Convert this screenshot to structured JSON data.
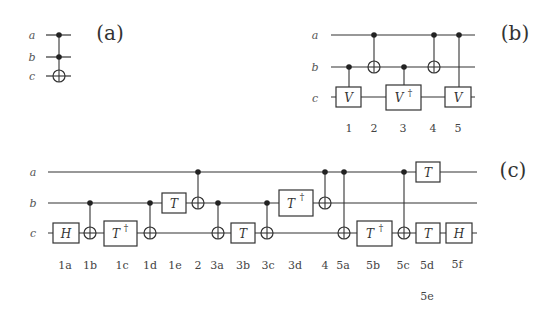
{
  "colors": {
    "background": "#ffffff",
    "ink": "#333333",
    "label": "#555555"
  },
  "panels": {
    "a": {
      "label": "(a)",
      "qubits": [
        "a",
        "b",
        "c"
      ],
      "description": "Toffoli gate: controls on a and b, target on c"
    },
    "b": {
      "label": "(b)",
      "qubits": [
        "a",
        "b",
        "c"
      ],
      "gates": [
        {
          "step": "1",
          "type": "controlled",
          "control": "b",
          "target": "c",
          "gate": "V"
        },
        {
          "step": "2",
          "type": "cnot",
          "control": "a",
          "target": "b"
        },
        {
          "step": "3",
          "type": "controlled",
          "control": "b",
          "target": "c",
          "gate": "V",
          "dagger": "†"
        },
        {
          "step": "4",
          "type": "cnot",
          "control": "a",
          "target": "b"
        },
        {
          "step": "5",
          "type": "controlled",
          "control": "a",
          "target": "c",
          "gate": "V"
        }
      ],
      "step_labels": [
        "1",
        "2",
        "3",
        "4",
        "5"
      ]
    },
    "c": {
      "label": "(c)",
      "qubits": [
        "a",
        "b",
        "c"
      ],
      "gates": [
        {
          "step": "1a",
          "type": "single",
          "target": "c",
          "gate": "H"
        },
        {
          "step": "1b",
          "type": "cnot",
          "control": "b",
          "target": "c"
        },
        {
          "step": "1c",
          "type": "single",
          "target": "c",
          "gate": "T",
          "dagger": "†"
        },
        {
          "step": "1d",
          "type": "cnot",
          "control": "b",
          "target": "c"
        },
        {
          "step": "1e",
          "type": "single",
          "target": "b",
          "gate": "T"
        },
        {
          "step": "2",
          "type": "cnot",
          "control": "a",
          "target": "b"
        },
        {
          "step": "3a",
          "type": "cnot",
          "control": "b",
          "target": "c"
        },
        {
          "step": "3b",
          "type": "single",
          "target": "c",
          "gate": "T"
        },
        {
          "step": "3c",
          "type": "cnot",
          "control": "b",
          "target": "c"
        },
        {
          "step": "3d",
          "type": "single",
          "target": "b",
          "gate": "T",
          "dagger": "†"
        },
        {
          "step": "4",
          "type": "cnot",
          "control": "a",
          "target": "b"
        },
        {
          "step": "5a",
          "type": "cnot",
          "control": "a",
          "target": "c"
        },
        {
          "step": "5b",
          "type": "single",
          "target": "c",
          "gate": "T",
          "dagger": "†"
        },
        {
          "step": "5c",
          "type": "cnot",
          "control": "a",
          "target": "c"
        },
        {
          "step": "5d",
          "type": "single",
          "target": "c",
          "gate": "T"
        },
        {
          "step": "5e",
          "type": "single",
          "target": "a",
          "gate": "T"
        },
        {
          "step": "5f",
          "type": "single",
          "target": "c",
          "gate": "H"
        }
      ],
      "step_labels": [
        "1a",
        "1b",
        "1c",
        "1d",
        "1e",
        "2",
        "3a",
        "3b",
        "3c",
        "3d",
        "4",
        "5a",
        "5b",
        "5c",
        "5d",
        "5f",
        "5e"
      ]
    }
  },
  "text": {
    "qa": "a",
    "qb": "b",
    "qc": "c",
    "V": "V",
    "T": "T",
    "H": "H",
    "dagger": "†"
  }
}
